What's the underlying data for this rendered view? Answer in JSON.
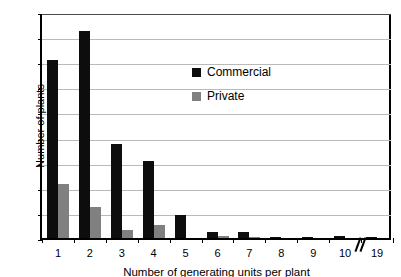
{
  "chart_data": {
    "type": "bar",
    "title": "",
    "subtitle": "",
    "xlabel": "Number of generating units per plant",
    "ylabel": "Number of plants",
    "categories": [
      "1",
      "2",
      "3",
      "4",
      "5",
      "6",
      "7",
      "8",
      "9",
      "10",
      "19"
    ],
    "series": [
      {
        "name": "Commercial",
        "color": "#0d0d0d",
        "values": [
          142,
          165,
          75,
          61,
          18,
          5,
          5,
          1,
          1,
          2,
          1
        ]
      },
      {
        "name": "Private",
        "color": "#808080",
        "values": [
          43,
          25,
          6,
          10,
          0,
          2,
          1,
          0,
          0,
          0,
          0
        ]
      }
    ],
    "ylim": [
      0,
      180
    ],
    "yticks": [
      0,
      20,
      40,
      60,
      80,
      100,
      120,
      140,
      160,
      180
    ],
    "grid": true,
    "legend_position": "inside-upper-center",
    "axis_break": {
      "after_category": "10",
      "label": "axis-break-slashes"
    }
  },
  "legend": {
    "items": [
      {
        "label": "Commercial",
        "swatch": "black-square-swatch"
      },
      {
        "label": "Private",
        "swatch": "gray-square-swatch"
      }
    ]
  }
}
